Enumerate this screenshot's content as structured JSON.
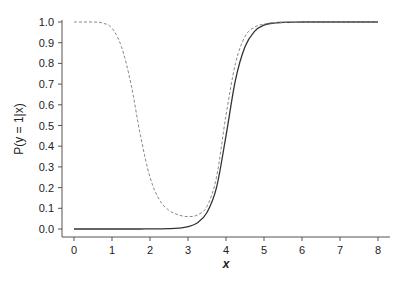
{
  "chart_data": {
    "type": "line",
    "title": "",
    "xlabel": "x",
    "ylabel": "P(y = 1|x)",
    "xlim": [
      0,
      8
    ],
    "ylim": [
      0,
      1
    ],
    "grid": false,
    "legend": null,
    "x_ticks": [
      0,
      1,
      2,
      3,
      4,
      5,
      6,
      7,
      8
    ],
    "y_ticks": [
      "0.0",
      "0.1",
      "0.2",
      "0.3",
      "0.4",
      "0.5",
      "0.6",
      "0.7",
      "0.8",
      "0.9",
      "1.0"
    ],
    "x": [
      0,
      0.25,
      0.5,
      0.75,
      1,
      1.25,
      1.5,
      1.75,
      2,
      2.25,
      2.5,
      2.75,
      3,
      3.25,
      3.5,
      3.75,
      4,
      4.25,
      4.5,
      4.75,
      5,
      5.25,
      5.5,
      5.75,
      6,
      6.5,
      7,
      7.5,
      8
    ],
    "series": [
      {
        "name": "solid",
        "style": "solid",
        "color": "#333333",
        "values": [
          0,
          0,
          0,
          0,
          0,
          0,
          0,
          0.0001,
          0.0002,
          0.0006,
          0.0015,
          0.004,
          0.011,
          0.03,
          0.08,
          0.2,
          0.45,
          0.72,
          0.88,
          0.955,
          0.985,
          0.995,
          0.998,
          0.999,
          1,
          1,
          1,
          1,
          1
        ]
      },
      {
        "name": "dashed",
        "style": "dashed",
        "color": "#888888",
        "values": [
          1,
          1,
          1,
          0.995,
          0.97,
          0.88,
          0.7,
          0.45,
          0.25,
          0.14,
          0.09,
          0.068,
          0.06,
          0.068,
          0.11,
          0.25,
          0.55,
          0.8,
          0.93,
          0.975,
          0.99,
          0.997,
          0.999,
          1,
          1,
          1,
          1,
          1,
          1
        ]
      }
    ]
  }
}
